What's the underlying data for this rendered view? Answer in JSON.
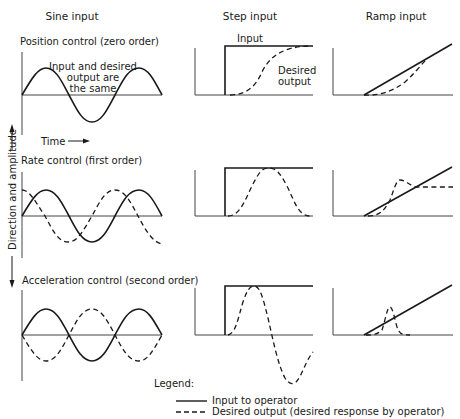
{
  "columns": {
    "sine": "Sine input",
    "step": "Step input",
    "ramp": "Ramp input"
  },
  "rows": [
    {
      "label": "Position control (zero order)",
      "order": 0
    },
    {
      "label": "Rate control  (first order)",
      "order": 1
    },
    {
      "label": "Acceleration control (second order)",
      "order": 2
    }
  ],
  "annotations": {
    "same_line1": "Input and desired",
    "same_line2": "output are",
    "same_line3": "the same",
    "step_input": "Input",
    "desired_line1": "Desired",
    "desired_line2": "output",
    "time": "Time",
    "y_axis": "Direction and amplitude"
  },
  "legend": {
    "title": "Legend:",
    "solid": "Input to operator",
    "dashed": "Desired output (desired response by operator)"
  },
  "colors": {
    "ink": "#1a1a1a",
    "axis": "#444444",
    "background": "#ffffff"
  }
}
